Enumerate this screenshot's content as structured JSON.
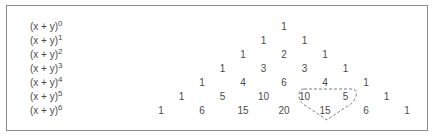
{
  "diagram": {
    "title": "",
    "rows": [
      {
        "label_base": "(x + y)",
        "exponent": "0",
        "values": [
          "1"
        ]
      },
      {
        "label_base": "(x + y)",
        "exponent": "1",
        "values": [
          "1",
          "1"
        ]
      },
      {
        "label_base": "(x + y)",
        "exponent": "2",
        "values": [
          "1",
          "2",
          "1"
        ]
      },
      {
        "label_base": "(x + y)",
        "exponent": "3",
        "values": [
          "1",
          "3",
          "3",
          "1"
        ]
      },
      {
        "label_base": "(x + y)",
        "exponent": "4",
        "values": [
          "1",
          "4",
          "6",
          "4",
          "1"
        ]
      },
      {
        "label_base": "(x + y)",
        "exponent": "5",
        "values": [
          "1",
          "5",
          "10",
          "10",
          "5",
          "1"
        ]
      },
      {
        "label_base": "(x + y)",
        "exponent": "6",
        "values": [
          "1",
          "6",
          "15",
          "20",
          "15",
          "6",
          "1"
        ]
      }
    ],
    "highlight": {
      "description": "dashed outline grouping 10 and 5 in row 5 with 15 in row 6",
      "members": [
        "10",
        "5",
        "15"
      ],
      "style": "dashed",
      "color": "#707070"
    },
    "colors": {
      "text": "#4a4a4a",
      "border": "#8a8a8a"
    }
  }
}
